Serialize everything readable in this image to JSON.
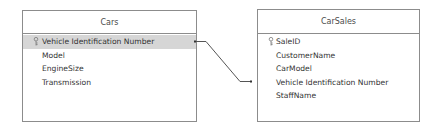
{
  "diagram": {
    "tables": [
      {
        "name": "Cars",
        "fields": [
          {
            "label": "Vehicle Identification Number",
            "primary_key": true,
            "selected": true
          },
          {
            "label": "Model",
            "primary_key": false,
            "selected": false
          },
          {
            "label": "EngineSize",
            "primary_key": false,
            "selected": false
          },
          {
            "label": "Transmission",
            "primary_key": false,
            "selected": false
          }
        ]
      },
      {
        "name": "CarSales",
        "fields": [
          {
            "label": "SaleID",
            "primary_key": true,
            "selected": false
          },
          {
            "label": "CustomerName",
            "primary_key": false,
            "selected": false
          },
          {
            "label": "CarModel",
            "primary_key": false,
            "selected": false
          },
          {
            "label": "Vehicle Identification Number",
            "primary_key": false,
            "selected": false
          },
          {
            "label": "StaffName",
            "primary_key": false,
            "selected": false
          }
        ]
      }
    ],
    "relationships": [
      {
        "from_table": "Cars",
        "from_field": "Vehicle Identification Number",
        "to_table": "CarSales",
        "to_field": "Vehicle Identification Number"
      }
    ],
    "icons": {
      "primary_key": "key-icon"
    },
    "colors": {
      "border": "#8c8c8c",
      "selected_row": "#d6d6d6",
      "text": "#333333",
      "line": "#555555"
    }
  }
}
